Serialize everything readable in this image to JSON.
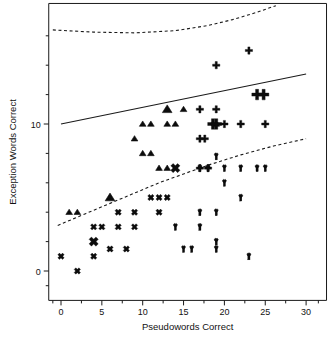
{
  "chart_data": {
    "type": "scatter",
    "title": "",
    "xlabel": "Pseudowords Correct",
    "ylabel": "Exception Words Correct",
    "xlim": [
      -1.5,
      32.5
    ],
    "ylim": [
      -2.0,
      18.2
    ],
    "xticks": [
      0,
      5,
      10,
      15,
      20,
      25,
      30
    ],
    "xticklabels": [
      "0",
      "5",
      "10",
      "15",
      "20",
      "25",
      "30"
    ],
    "xminorticks": [
      -1,
      2.5,
      7.5,
      12.5,
      17.5,
      22.5,
      27.5,
      31.5
    ],
    "yticks": [
      0,
      10
    ],
    "yticklabels": [
      "0",
      "10"
    ],
    "yminorticks": [
      -1,
      2,
      4,
      6,
      8,
      12,
      14,
      16
    ],
    "grid": false,
    "legend": false,
    "series": [
      {
        "name": "group-triangle",
        "marker": "triangle",
        "points": [
          {
            "x": 1,
            "y": 4,
            "size": "small"
          },
          {
            "x": 2,
            "y": 4,
            "size": "small"
          },
          {
            "x": 6,
            "y": 5,
            "size": "large"
          },
          {
            "x": 9,
            "y": 9,
            "size": "small"
          },
          {
            "x": 10,
            "y": 8,
            "size": "small"
          },
          {
            "x": 10,
            "y": 10,
            "size": "small"
          },
          {
            "x": 11,
            "y": 8,
            "size": "small"
          },
          {
            "x": 11,
            "y": 10,
            "size": "small"
          },
          {
            "x": 12,
            "y": 7,
            "size": "small"
          },
          {
            "x": 13,
            "y": 7,
            "size": "small"
          },
          {
            "x": 13,
            "y": 10,
            "size": "small"
          },
          {
            "x": 13,
            "y": 11,
            "size": "large"
          },
          {
            "x": 14,
            "y": 10,
            "size": "small"
          },
          {
            "x": 15,
            "y": 11,
            "size": "small"
          },
          {
            "x": 19,
            "y": 10,
            "size": "small"
          }
        ]
      },
      {
        "name": "group-plus",
        "marker": "plus",
        "points": [
          {
            "x": 17,
            "y": 7,
            "size": "small"
          },
          {
            "x": 17,
            "y": 9,
            "size": "small"
          },
          {
            "x": 17,
            "y": 11,
            "size": "small"
          },
          {
            "x": 17.6,
            "y": 9,
            "size": "small"
          },
          {
            "x": 18,
            "y": 7,
            "size": "small"
          },
          {
            "x": 18.6,
            "y": 10,
            "size": "large"
          },
          {
            "x": 19,
            "y": 14,
            "size": "small"
          },
          {
            "x": 19,
            "y": 10,
            "size": "large"
          },
          {
            "x": 19,
            "y": 11,
            "size": "small"
          },
          {
            "x": 20,
            "y": 10,
            "size": "small"
          },
          {
            "x": 22,
            "y": 10,
            "size": "small"
          },
          {
            "x": 23,
            "y": 15,
            "size": "small"
          },
          {
            "x": 24,
            "y": 12,
            "size": "large"
          },
          {
            "x": 24.8,
            "y": 12,
            "size": "large"
          },
          {
            "x": 25,
            "y": 10,
            "size": "small"
          }
        ]
      },
      {
        "name": "group-x",
        "marker": "x",
        "points": [
          {
            "x": 0,
            "y": 1,
            "size": "small"
          },
          {
            "x": 2,
            "y": 0,
            "size": "small"
          },
          {
            "x": 4,
            "y": 1,
            "size": "small"
          },
          {
            "x": 4,
            "y": 2,
            "size": "large"
          },
          {
            "x": 4,
            "y": 3,
            "size": "small"
          },
          {
            "x": 5,
            "y": 3,
            "size": "small"
          },
          {
            "x": 6,
            "y": 1.5,
            "size": "small"
          },
          {
            "x": 7,
            "y": 3,
            "size": "small"
          },
          {
            "x": 7,
            "y": 4,
            "size": "small"
          },
          {
            "x": 8,
            "y": 1.5,
            "size": "small"
          },
          {
            "x": 9,
            "y": 3,
            "size": "small"
          },
          {
            "x": 9,
            "y": 4,
            "size": "small"
          },
          {
            "x": 11,
            "y": 5,
            "size": "small"
          },
          {
            "x": 12,
            "y": 4,
            "size": "small"
          },
          {
            "x": 12,
            "y": 5,
            "size": "small"
          },
          {
            "x": 13,
            "y": 5,
            "size": "small"
          },
          {
            "x": 14,
            "y": 7,
            "size": "large"
          }
        ]
      },
      {
        "name": "group-y",
        "marker": "y",
        "points": [
          {
            "x": 14,
            "y": 3,
            "size": "small"
          },
          {
            "x": 15,
            "y": 1.5,
            "size": "small"
          },
          {
            "x": 16,
            "y": 1.5,
            "size": "small"
          },
          {
            "x": 17,
            "y": 7,
            "size": "small"
          },
          {
            "x": 17,
            "y": 4,
            "size": "small"
          },
          {
            "x": 17,
            "y": 3,
            "size": "small"
          },
          {
            "x": 18,
            "y": 7,
            "size": "small"
          },
          {
            "x": 19,
            "y": 7.8,
            "size": "small"
          },
          {
            "x": 19,
            "y": 4,
            "size": "small"
          },
          {
            "x": 19,
            "y": 2,
            "size": "small"
          },
          {
            "x": 19,
            "y": 1.5,
            "size": "small"
          },
          {
            "x": 20,
            "y": 7,
            "size": "small"
          },
          {
            "x": 20,
            "y": 6,
            "size": "small"
          },
          {
            "x": 22,
            "y": 7,
            "size": "small"
          },
          {
            "x": 22,
            "y": 5,
            "size": "small"
          },
          {
            "x": 23,
            "y": 1,
            "size": "small"
          },
          {
            "x": 24,
            "y": 7,
            "size": "small"
          },
          {
            "x": 25,
            "y": 7,
            "size": "small"
          }
        ]
      }
    ],
    "annotations": [
      {
        "name": "upper-dashed-boundary",
        "style": "dashed",
        "points": [
          {
            "x": -1.0,
            "y": 16.4
          },
          {
            "x": 4,
            "y": 16.25
          },
          {
            "x": 9,
            "y": 16.2
          },
          {
            "x": 14,
            "y": 16.35
          },
          {
            "x": 18,
            "y": 16.7
          },
          {
            "x": 21,
            "y": 17.1
          },
          {
            "x": 24,
            "y": 17.6
          },
          {
            "x": 26.3,
            "y": 18.05
          }
        ]
      },
      {
        "name": "solid-regression-line",
        "style": "solid",
        "points": [
          {
            "x": 0,
            "y": 10.0
          },
          {
            "x": 30,
            "y": 13.4
          }
        ]
      },
      {
        "name": "lower-dashed-boundary",
        "style": "dashed",
        "points": [
          {
            "x": -0.4,
            "y": 3.1
          },
          {
            "x": 3,
            "y": 3.9
          },
          {
            "x": 6,
            "y": 4.6
          },
          {
            "x": 9,
            "y": 5.3
          },
          {
            "x": 12,
            "y": 6.0
          },
          {
            "x": 15,
            "y": 6.6
          },
          {
            "x": 18,
            "y": 7.2
          },
          {
            "x": 22,
            "y": 7.9
          },
          {
            "x": 26,
            "y": 8.5
          },
          {
            "x": 30,
            "y": 9.0
          }
        ]
      }
    ]
  },
  "colors": {
    "marker": "#0c0c0c",
    "axis": "#1a1a1a",
    "background": "#ffffff"
  }
}
